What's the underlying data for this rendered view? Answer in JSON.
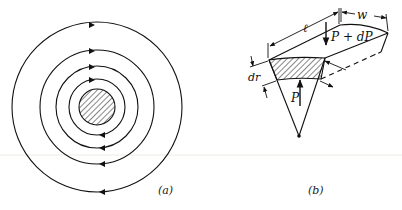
{
  "figure_a": {
    "caption": "(a)",
    "center": [
      97,
      107
    ],
    "core_radius": 18,
    "ring_radii": [
      28,
      41,
      57,
      85
    ]
  },
  "figure_b": {
    "caption": "(b)",
    "labels": {
      "length": "ℓ",
      "width": "w",
      "load_top": "P + dP",
      "load_bottom": "P",
      "thickness": "dr"
    }
  },
  "colors": {
    "ink": "#111111",
    "background": "#ffffff",
    "separator": "#ecebe3"
  }
}
